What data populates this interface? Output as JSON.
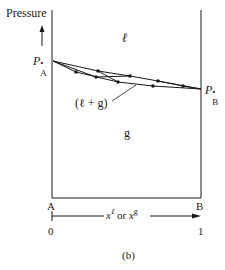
{
  "figure": {
    "y_axis_label": "Pressure",
    "region_liquid": "ℓ",
    "region_gas": "g",
    "region_two_phase": "(ℓ + g)",
    "pa_label": "P",
    "pa_sub": "A",
    "pa_sup": "•",
    "pb_label": "P",
    "pb_sub": "B",
    "pb_sup": "•",
    "left_component": "A",
    "right_component": "B",
    "x_axis_label_part1": "x",
    "x_axis_sup1": "ℓ",
    "x_axis_or": " or ",
    "x_axis_label_part2": "x",
    "x_axis_sup2": "g",
    "x_min": "0",
    "x_max": "1",
    "caption": "(b)"
  },
  "colors": {
    "ink": "#1a1a1a",
    "background": "#ffffff"
  }
}
